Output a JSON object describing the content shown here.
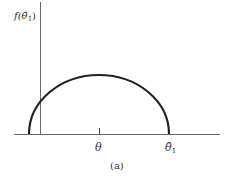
{
  "figure": {
    "caption": "(a)",
    "y_axis_label": "f(θ̂",
    "y_axis_label_sub": "1",
    "y_axis_label_close": ")",
    "x_tick_label": "θ",
    "x_end_label": "θ̂",
    "x_end_label_sub": "1",
    "curve": "semicircular density curve centered at θ",
    "colors": {
      "axis": "#555555",
      "curve": "#222222",
      "text": "#333333"
    }
  }
}
